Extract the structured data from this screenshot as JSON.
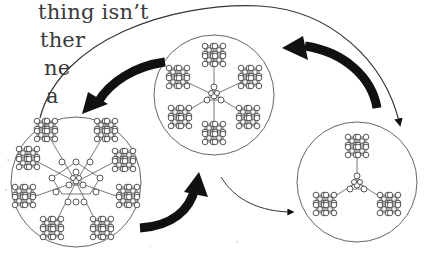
{
  "text_fragments": [
    {
      "text": "thing isn’t",
      "x": 38,
      "y": 2
    },
    {
      "text": "ther",
      "x": 40,
      "y": 30
    },
    {
      "text": "ne",
      "x": 44,
      "y": 58
    },
    {
      "text": "a",
      "x": 46,
      "y": 86
    }
  ],
  "diagram": {
    "type": "network-cluster-transitions",
    "colors": {
      "line": "#555555",
      "arrow": "#111111",
      "node_fill": "#ffffff"
    },
    "clusters": [
      {
        "id": "left",
        "label": "",
        "center": [
          76,
          182
        ],
        "radius": 65,
        "description": "central hub with 8 satellite clusters"
      },
      {
        "id": "middle",
        "label": "",
        "center": [
          214,
          95
        ],
        "radius": 60,
        "description": "central hub with 6 satellite clusters"
      },
      {
        "id": "right",
        "label": "",
        "center": [
          357,
          182
        ],
        "radius": 60,
        "description": "central hub with 3 satellite clusters"
      }
    ],
    "arrows": [
      {
        "from": "middle",
        "to": "left",
        "weight": "thick"
      },
      {
        "from": "left",
        "to": "middle",
        "weight": "thick"
      },
      {
        "from": "right",
        "to": "middle",
        "weight": "thick"
      },
      {
        "from": "middle",
        "to": "right",
        "weight": "thin"
      },
      {
        "from": "left",
        "to": "right",
        "weight": "thin",
        "path": "over-top"
      }
    ]
  }
}
